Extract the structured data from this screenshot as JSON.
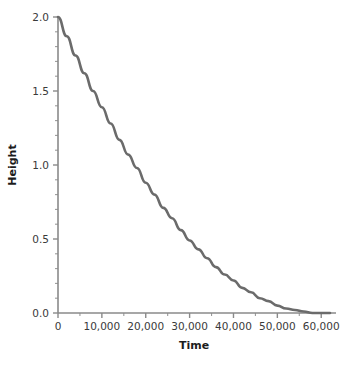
{
  "figure": {
    "background_color": "#ffffff",
    "axis_color": "#8a8a8a",
    "text_color": "#1c1c1c"
  },
  "chart_data": {
    "type": "line",
    "title": "",
    "subtitle": "",
    "xlabel": "Time",
    "ylabel": "Height",
    "xlim": [
      0,
      62000
    ],
    "ylim": [
      0,
      2.0
    ],
    "grid": false,
    "legend": "none",
    "line_color": "#6b6b6b",
    "line_width": 2.6,
    "x_ticks": [
      0,
      10000,
      20000,
      30000,
      40000,
      50000,
      60000
    ],
    "x_tick_labels": [
      "0",
      "10,000",
      "20,000",
      "30,000",
      "40,000",
      "50,000",
      "60,000"
    ],
    "x_minor_step": 5000,
    "y_ticks": [
      0.0,
      0.5,
      1.0,
      1.5,
      2.0
    ],
    "y_tick_labels": [
      "0.0",
      "0.5",
      "1.0",
      "1.5",
      "2.0"
    ],
    "y_minor_step": 0.1,
    "series": [
      {
        "name": "Height vs Time",
        "x": [
          0,
          2000,
          4000,
          6000,
          8000,
          10000,
          12000,
          14000,
          16000,
          18000,
          20000,
          22000,
          24000,
          26000,
          28000,
          30000,
          32000,
          34000,
          36000,
          38000,
          40000,
          42000,
          44000,
          46000,
          48000,
          50000,
          52000,
          54000,
          56000,
          58000,
          60000,
          62000
        ],
        "y": [
          2.0,
          1.87,
          1.74,
          1.62,
          1.5,
          1.39,
          1.28,
          1.17,
          1.07,
          0.98,
          0.88,
          0.8,
          0.71,
          0.64,
          0.56,
          0.49,
          0.43,
          0.37,
          0.31,
          0.26,
          0.22,
          0.17,
          0.14,
          0.1,
          0.08,
          0.05,
          0.03,
          0.02,
          0.01,
          0.0,
          0.0,
          0.0
        ]
      }
    ]
  },
  "caption": {
    "text": ""
  }
}
